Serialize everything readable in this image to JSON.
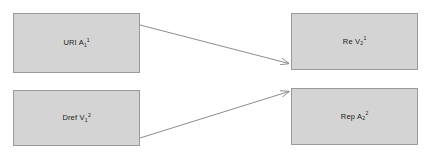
{
  "diagram": {
    "background_color": "#ffffff",
    "node_fill_color": "#d4d4d4",
    "node_border_color": "#9a9a9a",
    "arrow_color": "#7f7f7f",
    "nodes": [
      {
        "id": "uri",
        "base": "URI A",
        "subscript": "1",
        "superscript": "1",
        "full_label": "URI A1 1"
      },
      {
        "id": "dref",
        "base": "Dref V",
        "subscript": "1",
        "superscript": "2",
        "full_label": "Dref V1 2"
      },
      {
        "id": "re",
        "base": "Re V",
        "subscript": "2",
        "superscript": "1",
        "full_label": "Re V2 1"
      },
      {
        "id": "rep",
        "base": "Rep A",
        "subscript": "2",
        "superscript": "2",
        "full_label": "Rep A2 2"
      }
    ],
    "edges": [
      {
        "id": "uri-to-re",
        "from": "uri",
        "to": "re",
        "label": ""
      },
      {
        "id": "dref-to-rep",
        "from": "dref",
        "to": "rep",
        "label": ""
      }
    ]
  }
}
